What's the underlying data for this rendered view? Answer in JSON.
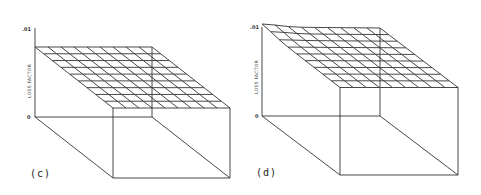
{
  "chart_data": [
    {
      "type": "surface3d",
      "panel_label": "(c)",
      "zlabel": "LOSS FACTOR",
      "ztick_top": ".01",
      "ztick_bottom": "0",
      "zlim": [
        0,
        0.01
      ],
      "grid": [
        9,
        9
      ],
      "description": "Flat surface of loss factor near top of box, nearly uniform across grid",
      "surface_level": 0.0072
    },
    {
      "type": "surface3d",
      "panel_label": "(d)",
      "zlabel": "LOSS FACTOR",
      "ztick_top": ".01",
      "ztick_bottom": "0",
      "zlim": [
        0,
        0.01
      ],
      "grid": [
        9,
        9
      ],
      "description": "Surface slightly higher than (c) with a peak at back-left corner reaching .01",
      "surface_level": 0.0088
    }
  ],
  "panels": {
    "c": {
      "label": "(c)",
      "ylabel": "LOSS FACTOR",
      "top_tick": ".01",
      "bottom_tick": "0"
    },
    "d": {
      "label": "(d)",
      "ylabel": "LOSS FACTOR",
      "top_tick": ".01",
      "bottom_tick": "0"
    }
  }
}
